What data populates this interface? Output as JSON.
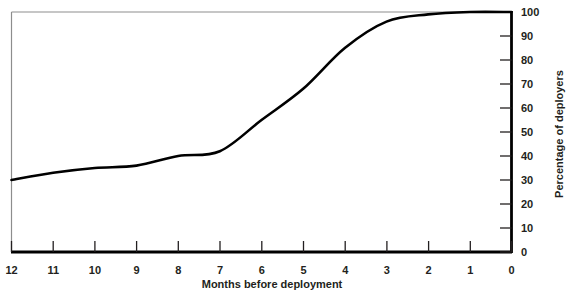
{
  "chart_data": {
    "type": "line",
    "title": "",
    "subtitle": "",
    "xlabel": "Months before deployment",
    "ylabel": "Percentage of deployers",
    "x": [
      12,
      11,
      10,
      9,
      8,
      7,
      6,
      5,
      4,
      3,
      2,
      1,
      0
    ],
    "xtick_labels": [
      "12",
      "11",
      "10",
      "9",
      "8",
      "7",
      "6",
      "5",
      "4",
      "3",
      "2",
      "1",
      "0"
    ],
    "ytick_labels": [
      "0",
      "10",
      "20",
      "30",
      "40",
      "50",
      "60",
      "70",
      "80",
      "90",
      "100"
    ],
    "ytick_values": [
      0,
      10,
      20,
      30,
      40,
      50,
      60,
      70,
      80,
      90,
      100
    ],
    "xlim": [
      12,
      0
    ],
    "ylim": [
      0,
      100
    ],
    "x_axis_direction": "descending",
    "y_axis_position": "right",
    "grid": false,
    "legend": null,
    "series": [
      {
        "name": "Percentage of deployers",
        "color": "#000000",
        "line_width": 2.6,
        "values": [
          30,
          33,
          35,
          36,
          40,
          42,
          55,
          68,
          85,
          96,
          99,
          100,
          100
        ]
      }
    ],
    "annotations": []
  },
  "axes": {
    "x_title": "Months before deployment",
    "y_title": "Percentage of deployers",
    "x_ticks": [
      "12",
      "11",
      "10",
      "9",
      "8",
      "7",
      "6",
      "5",
      "4",
      "3",
      "2",
      "1",
      "0"
    ],
    "y_ticks": [
      "100",
      "90",
      "80",
      "70",
      "60",
      "50",
      "40",
      "30",
      "20",
      "10",
      "0"
    ],
    "origin_label": "0"
  },
  "style": {
    "line_color": "#000000",
    "axis_color": "#000000",
    "frame_color": "#8d8d8d",
    "text_color": "#231f20",
    "background": "#ffffff"
  }
}
